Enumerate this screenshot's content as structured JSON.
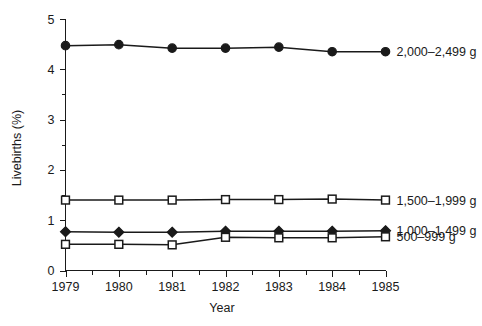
{
  "chart_data": {
    "type": "line",
    "title": "",
    "subtitle": "",
    "xlabel": "Year",
    "ylabel": "Livebirths (%)",
    "x": [
      1979,
      1980,
      1981,
      1982,
      1983,
      1984,
      1985
    ],
    "xlim": [
      1979,
      1985
    ],
    "ylim": [
      0,
      5
    ],
    "x_tick_labels": [
      "1979",
      "1980",
      "1981",
      "1982",
      "1983",
      "1984",
      "1985"
    ],
    "y_tick_labels": [
      "0",
      "1",
      "2",
      "3",
      "4",
      "5"
    ],
    "y_major_ticks": [
      0,
      1,
      2,
      3,
      4,
      5
    ],
    "y_minor_ticks": [
      0.5,
      1.5,
      2.5,
      3.5,
      4.5
    ],
    "x_minor_ticks": [
      1979.5,
      1980.5,
      1981.5,
      1982.5,
      1983.5,
      1984.5
    ],
    "grid": false,
    "legend_position": "right-of-plot",
    "series": [
      {
        "name": "2,000–2,499 g",
        "marker": "filled-circle",
        "label_x": 1985,
        "values": [
          4.47,
          4.49,
          4.42,
          4.42,
          4.44,
          4.35,
          4.35
        ]
      },
      {
        "name": "1,500–1,999 g",
        "marker": "open-square",
        "label_x": 1985,
        "values": [
          1.4,
          1.4,
          1.4,
          1.41,
          1.41,
          1.42,
          1.4
        ]
      },
      {
        "name": "1,000–1,499 g",
        "marker": "filled-diamond",
        "label_x": 1985,
        "values": [
          0.77,
          0.76,
          0.76,
          0.78,
          0.78,
          0.78,
          0.79
        ]
      },
      {
        "name": "500–999 g",
        "marker": "open-square",
        "label_x": 1985,
        "values": [
          0.52,
          0.52,
          0.51,
          0.66,
          0.65,
          0.65,
          0.67
        ]
      }
    ]
  },
  "axes": {
    "y_title": "Livebirths (%)",
    "x_title": "Year"
  },
  "legend": {
    "entries": [
      {
        "label": "2,000–2,499 g"
      },
      {
        "label": "1,500–1,999 g"
      },
      {
        "label": "1,000–1,499 g"
      },
      {
        "label": "500–999 g"
      }
    ]
  },
  "ticks": {
    "y": [
      "5",
      "4",
      "3",
      "2",
      "1",
      "0"
    ],
    "x": [
      "1979",
      "1980",
      "1981",
      "1982",
      "1983",
      "1984",
      "1985"
    ]
  },
  "colors": {
    "ink": "#1a1a1a",
    "background": "#ffffff"
  }
}
